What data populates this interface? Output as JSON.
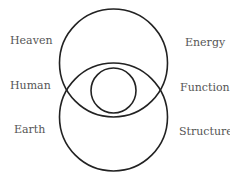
{
  "diagram": {
    "colors": {
      "stroke": "#222222",
      "text": "#555555",
      "background": "#ffffff"
    },
    "circles": [
      {
        "name": "upper-circle",
        "cx": 113.5,
        "cy": 63,
        "r": 54
      },
      {
        "name": "lower-circle",
        "cx": 113.5,
        "cy": 117,
        "r": 54
      },
      {
        "name": "inner-circle",
        "cx": 113.5,
        "cy": 90.5,
        "r": 22.5
      }
    ],
    "left_labels": [
      {
        "text": "Heaven",
        "x": 10,
        "y": 41
      },
      {
        "text": "Human",
        "x": 10,
        "y": 86
      },
      {
        "text": "Earth",
        "x": 14,
        "y": 130
      }
    ],
    "right_labels": [
      {
        "text": "Energy",
        "x": 185,
        "y": 43
      },
      {
        "text": "Function",
        "x": 180,
        "y": 88
      },
      {
        "text": "Structure",
        "x": 179,
        "y": 132
      }
    ]
  }
}
